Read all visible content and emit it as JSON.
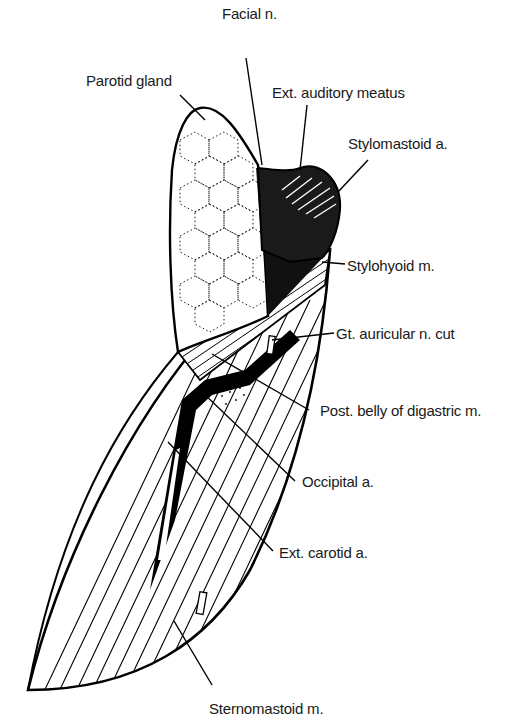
{
  "figure": {
    "labels": [
      {
        "id": "facial-n",
        "text": "Facial n.",
        "x": 222,
        "y": 6
      },
      {
        "id": "parotid-gland",
        "text": "Parotid gland",
        "x": 86,
        "y": 73
      },
      {
        "id": "ext-auditory-meatus",
        "text": "Ext. auditory meatus",
        "x": 272,
        "y": 85
      },
      {
        "id": "stylomastoid-a",
        "text": "Stylomastoid a.",
        "x": 348,
        "y": 136
      },
      {
        "id": "stylohyoid-m",
        "text": "Stylohyoid m.",
        "x": 347,
        "y": 258
      },
      {
        "id": "gt-auricular-n-cut",
        "text": "Gt. auricular n. cut",
        "x": 336,
        "y": 326
      },
      {
        "id": "post-belly-digastric-m",
        "text": "Post. belly of digastric m.",
        "x": 320,
        "y": 409
      },
      {
        "id": "occipital-a",
        "text": "Occipital a.",
        "x": 302,
        "y": 478
      },
      {
        "id": "ext-carotid-a",
        "text": "Ext. carotid a.",
        "x": 279,
        "y": 539
      },
      {
        "id": "sternomastoid-m",
        "text": "Sternomastoid m.",
        "x": 209,
        "y": 701
      }
    ]
  }
}
